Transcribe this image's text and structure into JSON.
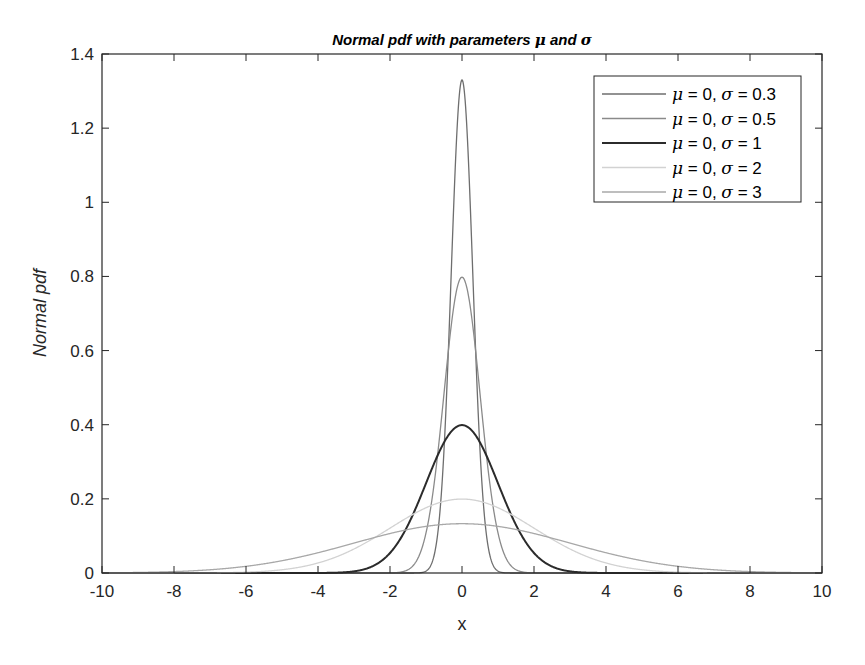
{
  "chart_data": {
    "type": "line",
    "title": "Normal pdf with parameters μ and σ",
    "title_parts": {
      "prefix": "Normal pdf with parameters ",
      "mu": "μ",
      "and": " and ",
      "sigma": "σ"
    },
    "xlabel": "x",
    "ylabel": "Normal pdf",
    "xlim": [
      -10,
      10
    ],
    "ylim": [
      0,
      1.4
    ],
    "xticks": [
      -10,
      -8,
      -6,
      -4,
      -2,
      0,
      2,
      4,
      6,
      8,
      10
    ],
    "xtick_labels": [
      "-10",
      "-8",
      "-6",
      "-4",
      "-2",
      "0",
      "2",
      "4",
      "6",
      "8",
      "10"
    ],
    "yticks": [
      0,
      0.2,
      0.4,
      0.6,
      0.8,
      1,
      1.2,
      1.4
    ],
    "ytick_labels": [
      "0",
      "0.2",
      "0.4",
      "0.6",
      "0.8",
      "1",
      "1.2",
      "1.4"
    ],
    "grid": false,
    "legend_position": "northeast",
    "series": [
      {
        "name": "μ = 0, σ = 0.3",
        "mu": 0,
        "sigma": 0.3,
        "peak": 1.33,
        "color": "#6e6e6e",
        "width": 1.3
      },
      {
        "name": "μ = 0, σ = 0.5",
        "mu": 0,
        "sigma": 0.5,
        "peak": 0.798,
        "color": "#8a8a8a",
        "width": 1.3
      },
      {
        "name": "μ = 0, σ = 1",
        "mu": 0,
        "sigma": 1,
        "peak": 0.399,
        "color": "#2b2b2b",
        "width": 2
      },
      {
        "name": "μ = 0, σ = 2",
        "mu": 0,
        "sigma": 2,
        "peak": 0.199,
        "color": "#d2d2d2",
        "width": 1.3
      },
      {
        "name": "μ = 0, σ = 3",
        "mu": 0,
        "sigma": 3,
        "peak": 0.133,
        "color": "#a8a8a8",
        "width": 1.3
      }
    ],
    "legend": [
      {
        "mu_sym": "μ",
        "eq1": " = 0, ",
        "sigma_sym": "σ",
        "eq2": " = 0.3"
      },
      {
        "mu_sym": "μ",
        "eq1": " = 0, ",
        "sigma_sym": "σ",
        "eq2": " = 0.5"
      },
      {
        "mu_sym": "μ",
        "eq1": " = 0, ",
        "sigma_sym": "σ",
        "eq2": " = 1"
      },
      {
        "mu_sym": "μ",
        "eq1": " = 0, ",
        "sigma_sym": "σ",
        "eq2": " = 2"
      },
      {
        "mu_sym": "μ",
        "eq1": " = 0, ",
        "sigma_sym": "σ",
        "eq2": " = 3"
      }
    ]
  }
}
